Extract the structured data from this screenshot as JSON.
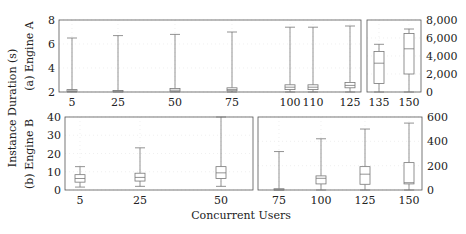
{
  "chart_data": [
    {
      "id": "engine_a_left",
      "type": "boxplot",
      "row_label": "(a) Engine A",
      "xlabel": "Concurrent Users",
      "ylabel": "Instance Duration (s)",
      "yaxis_side": "left",
      "ylim": [
        2,
        8
      ],
      "yticks": [
        2,
        4,
        6,
        8
      ],
      "ytick_labels": [
        "2",
        "4",
        "6",
        "8"
      ],
      "categories": [
        "5",
        "25",
        "50",
        "75",
        "100",
        "110",
        "125"
      ],
      "boxes": [
        {
          "x": "5",
          "whisker_low": 2.0,
          "q1": 2.05,
          "median": 2.1,
          "q3": 2.2,
          "whisker_high": 6.5
        },
        {
          "x": "25",
          "whisker_low": 2.0,
          "q1": 2.03,
          "median": 2.07,
          "q3": 2.12,
          "whisker_high": 6.7
        },
        {
          "x": "50",
          "whisker_low": 2.0,
          "q1": 2.05,
          "median": 2.15,
          "q3": 2.3,
          "whisker_high": 6.8
        },
        {
          "x": "75",
          "whisker_low": 2.0,
          "q1": 2.1,
          "median": 2.2,
          "q3": 2.35,
          "whisker_high": 7.0
        },
        {
          "x": "100",
          "whisker_low": 2.0,
          "q1": 2.2,
          "median": 2.4,
          "q3": 2.6,
          "whisker_high": 7.4
        },
        {
          "x": "110",
          "whisker_low": 2.0,
          "q1": 2.2,
          "median": 2.4,
          "q3": 2.6,
          "whisker_high": 7.4
        },
        {
          "x": "125",
          "whisker_low": 2.0,
          "q1": 2.35,
          "median": 2.55,
          "q3": 2.8,
          "whisker_high": 7.5
        }
      ]
    },
    {
      "id": "engine_a_right",
      "type": "boxplot",
      "row_label": "(a) Engine A",
      "yaxis_side": "right",
      "ylim": [
        0,
        8000
      ],
      "yticks": [
        0,
        2000,
        4000,
        6000,
        8000
      ],
      "ytick_labels": [
        "0",
        "2,000",
        "4,000",
        "6,000",
        "8,000"
      ],
      "categories": [
        "135",
        "150"
      ],
      "boxes": [
        {
          "x": "135",
          "whisker_low": 0,
          "q1": 950,
          "median": 3200,
          "q3": 4500,
          "whisker_high": 5300
        },
        {
          "x": "150",
          "whisker_low": 0,
          "q1": 2000,
          "median": 4800,
          "q3": 6500,
          "whisker_high": 7000
        }
      ]
    },
    {
      "id": "engine_b_left",
      "type": "boxplot",
      "row_label": "(b) Engine B",
      "yaxis_side": "left",
      "ylim": [
        0,
        40
      ],
      "yticks": [
        0,
        10,
        20,
        30,
        40
      ],
      "ytick_labels": [
        "0",
        "10",
        "20",
        "30",
        "40"
      ],
      "categories": [
        "5",
        "25",
        "50"
      ],
      "boxes": [
        {
          "x": "5",
          "whisker_low": 1.6,
          "q1": 4.3,
          "median": 6.3,
          "q3": 8.4,
          "whisker_high": 12.8
        },
        {
          "x": "25",
          "whisker_low": 2.0,
          "q1": 4.9,
          "median": 6.9,
          "q3": 9.2,
          "whisker_high": 23.1
        },
        {
          "x": "50",
          "whisker_low": 2.0,
          "q1": 6.3,
          "median": 9.4,
          "q3": 12.8,
          "whisker_high": 40.0
        }
      ]
    },
    {
      "id": "engine_b_right",
      "type": "boxplot",
      "row_label": "(b) Engine B",
      "yaxis_side": "right",
      "ylim": [
        0,
        600
      ],
      "yticks": [
        0,
        200,
        400,
        600
      ],
      "ytick_labels": [
        "0",
        "200",
        "400",
        "600"
      ],
      "categories": [
        "75",
        "100",
        "125",
        "150"
      ],
      "boxes": [
        {
          "x": "75",
          "whisker_low": 0,
          "q1": 2,
          "median": 5,
          "q3": 10,
          "whisker_high": 316
        },
        {
          "x": "100",
          "whisker_low": 0,
          "q1": 50,
          "median": 96,
          "q3": 116,
          "whisker_high": 421
        },
        {
          "x": "125",
          "whisker_low": 0,
          "q1": 47,
          "median": 130,
          "q3": 192,
          "whisker_high": 501
        },
        {
          "x": "150",
          "whisker_low": 0,
          "q1": 50,
          "median": 60,
          "q3": 225,
          "whisker_high": 550
        }
      ]
    }
  ],
  "labels": {
    "ylabel": "Instance Duration (s)",
    "row_a": "(a) Engine A",
    "row_b": "(b) Engine B",
    "xlabel": "Concurrent Users"
  },
  "style": {
    "axis_color": "#555555",
    "box_color": "#777777",
    "grid_color": "#e6e6e6"
  }
}
